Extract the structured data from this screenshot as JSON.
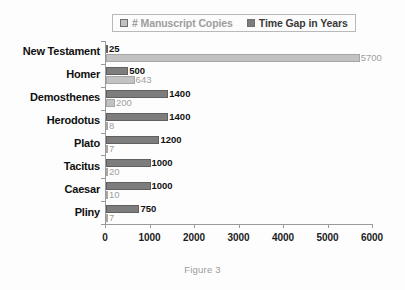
{
  "caption": "Figure 3",
  "legend": {
    "entries": [
      {
        "label": "# Manuscript Copies",
        "color": "#c2c2c2",
        "key": "copies"
      },
      {
        "label": "Time Gap in Years",
        "color": "#7d7d7d",
        "key": "gap"
      }
    ]
  },
  "chart_data": {
    "type": "bar",
    "orientation": "horizontal",
    "title": "",
    "xlabel": "",
    "ylabel": "",
    "xlim": [
      0,
      6000
    ],
    "xticks": [
      0,
      1000,
      2000,
      3000,
      4000,
      5000,
      6000
    ],
    "xtick_labels": [
      "0",
      "1000",
      "2000",
      "3000",
      "4000",
      "5000",
      "6000"
    ],
    "grid": false,
    "legend_position": "top",
    "categories": [
      "New Testament",
      "Homer",
      "Demosthenes",
      "Herodotus",
      "Plato",
      "Tacitus",
      "Caesar",
      "Pliny"
    ],
    "series": [
      {
        "name": "Time Gap in Years",
        "color": "#7d7d7d",
        "values": [
          25,
          500,
          1400,
          1400,
          1200,
          1000,
          1000,
          750
        ],
        "labels": [
          "25",
          "500",
          "1400",
          "1400",
          "1200",
          "1000",
          "1000",
          "750"
        ]
      },
      {
        "name": "# Manuscript Copies",
        "color": "#c2c2c2",
        "values": [
          5700,
          643,
          200,
          8,
          7,
          20,
          10,
          7
        ],
        "labels": [
          "5700",
          "643",
          "200",
          "8",
          "7",
          "20",
          "10",
          "7"
        ]
      }
    ]
  }
}
